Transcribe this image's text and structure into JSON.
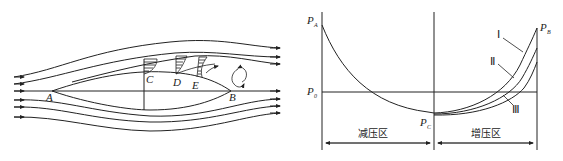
{
  "left_diagram": {
    "title": "Flow around a streamlined body with boundary layer separation",
    "points": {
      "A": "A",
      "B": "B",
      "C": "C",
      "D": "D",
      "E": "E"
    }
  },
  "right_diagram": {
    "pressure_labels": {
      "PA": {
        "main": "P",
        "sub": "A"
      },
      "PB": {
        "main": "P",
        "sub": "B"
      },
      "P0": {
        "main": "P",
        "sub": "0"
      },
      "PC": {
        "main": "P",
        "sub": "C"
      }
    },
    "curve_labels": {
      "I": "Ⅰ",
      "II": "Ⅱ",
      "III": "Ⅲ"
    },
    "zones": {
      "decrease": "减压区",
      "increase": "增压区"
    }
  }
}
